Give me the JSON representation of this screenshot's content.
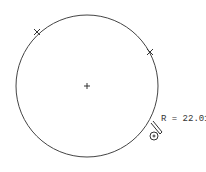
{
  "drawing": {
    "circle": {
      "cx": 87,
      "cy": 86,
      "r": 71
    },
    "radius_label": "R = 22.01",
    "markers": [
      {
        "name": "marker-1",
        "x": 37,
        "y": 32
      },
      {
        "name": "marker-2",
        "x": 150,
        "y": 52
      }
    ],
    "center_mark": {
      "x": 87,
      "y": 86
    },
    "stroke_color": "#333333"
  }
}
